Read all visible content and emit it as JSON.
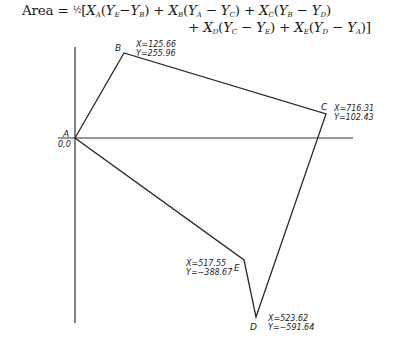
{
  "formula": {
    "prefix": "Area = ",
    "half": "½",
    "line1_terms": [
      {
        "x": "A",
        "y1": "E",
        "y2": "B",
        "op": "−"
      },
      {
        "x": "B",
        "y1": "A",
        "y2": "C",
        "op": "−"
      },
      {
        "x": "C",
        "y1": "B",
        "y2": "D",
        "op": "−"
      }
    ],
    "line2_terms": [
      {
        "x": "D",
        "y1": "C",
        "y2": "E",
        "op": "−"
      },
      {
        "x": "E",
        "y1": "D",
        "y2": "A",
        "op": "−"
      }
    ],
    "text_line1": "Area = ½[X_A(Y_E−Y_B) + X_B(Y_A − Y_C) + X_C(Y_B − Y_D)",
    "text_line2": "+ X_D(Y_C − Y_E) + X_E(Y_D − Y_A)]"
  },
  "diagram": {
    "axes": {
      "x_axis": {
        "x1": 58,
        "y1": 138,
        "x2": 353,
        "y2": 138
      },
      "y_axis": {
        "x1": 75,
        "y1": 47,
        "x2": 75,
        "y2": 323
      }
    },
    "origin_label": "0,0",
    "points": [
      {
        "name": "A",
        "px": 75,
        "py": 138,
        "x_label": "",
        "y_label": ""
      },
      {
        "name": "B",
        "px": 124,
        "py": 53,
        "x_label": "X=125.66",
        "y_label": "Y=255.96"
      },
      {
        "name": "C",
        "px": 326,
        "py": 114,
        "x_label": "X=716.31",
        "y_label": "Y=102.43"
      },
      {
        "name": "D",
        "px": 256,
        "py": 317,
        "x_label": "X=523.62",
        "y_label": "Y=−591.64"
      },
      {
        "name": "E",
        "px": 244,
        "py": 260,
        "x_label": "X=517.55",
        "y_label": "Y=−388.67"
      }
    ],
    "polygon_order": [
      "A",
      "B",
      "C",
      "D",
      "E"
    ],
    "stroke_color": "#2a2a2a"
  }
}
